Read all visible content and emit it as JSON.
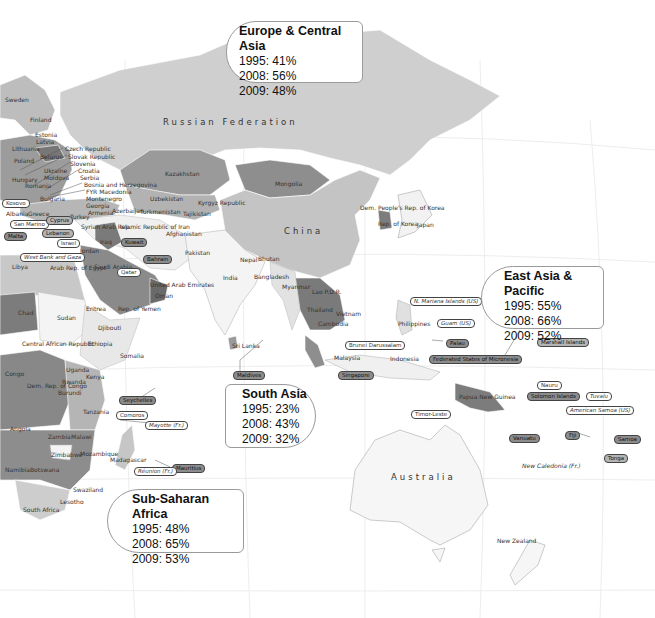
{
  "map": {
    "colors": {
      "ocean": "#ffffff",
      "graticule": "#e6e6e6",
      "shade_darkest": "#6e6e6e",
      "shade_dark": "#8f8f8f",
      "shade_mid": "#b0b0b0",
      "shade_light": "#cfcfcf",
      "shade_lightest": "#f2f2f2"
    },
    "big_labels": {
      "russia": "Russian Federation",
      "china": "China",
      "australia": "Australia"
    },
    "country_labels": [
      {
        "id": "sweden",
        "text": "Sweden",
        "x": 5,
        "y": 96
      },
      {
        "id": "finland",
        "text": "Finland",
        "x": 30,
        "y": 116
      },
      {
        "id": "estonia",
        "text": "Estonia",
        "x": 35,
        "y": 131
      },
      {
        "id": "latvia",
        "text": "Latvia",
        "x": 36,
        "y": 138
      },
      {
        "id": "lithuania",
        "text": "Lithuania",
        "x": 12,
        "y": 145
      },
      {
        "id": "poland",
        "text": "Poland",
        "x": 14,
        "y": 157
      },
      {
        "id": "belarus",
        "text": "Belarus",
        "x": 40,
        "y": 153
      },
      {
        "id": "czech",
        "text": "Czech Republic",
        "x": 65,
        "y": 145
      },
      {
        "id": "slovak",
        "text": "Slovak Republic",
        "x": 68,
        "y": 153
      },
      {
        "id": "slovenia",
        "text": "Slovenia",
        "x": 70,
        "y": 160
      },
      {
        "id": "ukraine",
        "text": "Ukraine",
        "x": 44,
        "y": 167
      },
      {
        "id": "croatia",
        "text": "Croatia",
        "x": 78,
        "y": 167
      },
      {
        "id": "hungary",
        "text": "Hungary",
        "x": 12,
        "y": 176
      },
      {
        "id": "moldova",
        "text": "Moldova",
        "x": 44,
        "y": 174
      },
      {
        "id": "serbia",
        "text": "Serbia",
        "x": 80,
        "y": 174
      },
      {
        "id": "romania",
        "text": "Romania",
        "x": 25,
        "y": 182
      },
      {
        "id": "bosnia",
        "text": "Bosnia and Herzegovina",
        "x": 84,
        "y": 181
      },
      {
        "id": "fyrom",
        "text": "FYR Macedonia",
        "x": 86,
        "y": 188
      },
      {
        "id": "montenegro",
        "text": "Montenegro",
        "x": 86,
        "y": 195
      },
      {
        "id": "georgia",
        "text": "Georgia",
        "x": 86,
        "y": 202
      },
      {
        "id": "bulgaria",
        "text": "Bulgaria",
        "x": 40,
        "y": 195
      },
      {
        "id": "armenia",
        "text": "Armenia",
        "x": 88,
        "y": 209
      },
      {
        "id": "azerbaijan",
        "text": "Azerbaijan",
        "x": 112,
        "y": 207
      },
      {
        "id": "albania",
        "text": "Albania",
        "x": 6,
        "y": 210
      },
      {
        "id": "greece",
        "text": "Greece",
        "x": 28,
        "y": 210
      },
      {
        "id": "turkey",
        "text": "Turkey",
        "x": 70,
        "y": 213
      },
      {
        "id": "kazakhstan",
        "text": "Kazakhstan",
        "x": 165,
        "y": 170
      },
      {
        "id": "mongolia",
        "text": "Mongolia",
        "x": 275,
        "y": 180
      },
      {
        "id": "uzbekistan",
        "text": "Uzbekistan",
        "x": 150,
        "y": 195
      },
      {
        "id": "kyrgyz",
        "text": "Kyrgyz Republic",
        "x": 198,
        "y": 199
      },
      {
        "id": "turkmenistan",
        "text": "Turkmenistan",
        "x": 140,
        "y": 208
      },
      {
        "id": "tajikistan",
        "text": "Tajikistan",
        "x": 183,
        "y": 210
      },
      {
        "id": "syria",
        "text": "Syrian Arab Rep.",
        "x": 81,
        "y": 223
      },
      {
        "id": "iran",
        "text": "Islamic Republic of Iran",
        "x": 120,
        "y": 223
      },
      {
        "id": "afghanistan",
        "text": "Afghanistan",
        "x": 166,
        "y": 230
      },
      {
        "id": "iraq",
        "text": "Iraq",
        "x": 100,
        "y": 238
      },
      {
        "id": "jordan",
        "text": "Jordan",
        "x": 80,
        "y": 247
      },
      {
        "id": "pakistan",
        "text": "Pakistan",
        "x": 185,
        "y": 249
      },
      {
        "id": "nepal",
        "text": "Nepal",
        "x": 240,
        "y": 256
      },
      {
        "id": "bhutan",
        "text": "Bhutan",
        "x": 258,
        "y": 255
      },
      {
        "id": "libya",
        "text": "Libya",
        "x": 12,
        "y": 263
      },
      {
        "id": "egypt",
        "text": "Arab Rep. of Egypt",
        "x": 50,
        "y": 264
      },
      {
        "id": "saudi",
        "text": "Saudi Arabia",
        "x": 94,
        "y": 263
      },
      {
        "id": "india",
        "text": "India",
        "x": 223,
        "y": 274
      },
      {
        "id": "bangladesh",
        "text": "Bangladesh",
        "x": 254,
        "y": 273
      },
      {
        "id": "uae",
        "text": "United Arab Emirates",
        "x": 150,
        "y": 281
      },
      {
        "id": "myanmar",
        "text": "Myanmar",
        "x": 282,
        "y": 283
      },
      {
        "id": "oman",
        "text": "Oman",
        "x": 155,
        "y": 292
      },
      {
        "id": "laos",
        "text": "Lao P.D.R.",
        "x": 312,
        "y": 288
      },
      {
        "id": "dprk",
        "text": "Dem. People's Rep. of Korea",
        "x": 360,
        "y": 204
      },
      {
        "id": "rok",
        "text": "Rep. of Korea",
        "x": 378,
        "y": 220
      },
      {
        "id": "japan",
        "text": "Japan",
        "x": 417,
        "y": 221
      },
      {
        "id": "thailand",
        "text": "Thailand",
        "x": 307,
        "y": 306
      },
      {
        "id": "vietnam",
        "text": "Vietnam",
        "x": 336,
        "y": 310
      },
      {
        "id": "philippines",
        "text": "Philippines",
        "x": 398,
        "y": 320
      },
      {
        "id": "cambodia",
        "text": "Cambodia",
        "x": 318,
        "y": 320
      },
      {
        "id": "chad",
        "text": "Chad",
        "x": 18,
        "y": 309
      },
      {
        "id": "sudan",
        "text": "Sudan",
        "x": 57,
        "y": 314
      },
      {
        "id": "eritrea",
        "text": "Eritrea",
        "x": 86,
        "y": 305
      },
      {
        "id": "yemen",
        "text": "Rep. of Yemen",
        "x": 118,
        "y": 305
      },
      {
        "id": "djibouti",
        "text": "Djibouti",
        "x": 98,
        "y": 324
      },
      {
        "id": "ethiopia",
        "text": "Ethiopia",
        "x": 88,
        "y": 340
      },
      {
        "id": "car",
        "text": "Central African Republic",
        "x": 22,
        "y": 340
      },
      {
        "id": "somalia",
        "text": "Somalia",
        "x": 120,
        "y": 352
      },
      {
        "id": "srilanka",
        "text": "Sri Lanka",
        "x": 232,
        "y": 342
      },
      {
        "id": "malaysia",
        "text": "Malaysia",
        "x": 334,
        "y": 354
      },
      {
        "id": "indonesia",
        "text": "Indonesia",
        "x": 390,
        "y": 355
      },
      {
        "id": "congo",
        "text": "Congo",
        "x": 5,
        "y": 370
      },
      {
        "id": "uganda",
        "text": "Uganda",
        "x": 66,
        "y": 366
      },
      {
        "id": "kenya",
        "text": "Kenya",
        "x": 86,
        "y": 373
      },
      {
        "id": "rwanda",
        "text": "Rwanda",
        "x": 62,
        "y": 378
      },
      {
        "id": "drc",
        "text": "Dem. Rep. of Congo",
        "x": 27,
        "y": 382
      },
      {
        "id": "burundi",
        "text": "Burundi",
        "x": 58,
        "y": 389
      },
      {
        "id": "png",
        "text": "Papua New Guinea",
        "x": 459,
        "y": 393
      },
      {
        "id": "tanzania",
        "text": "Tanzania",
        "x": 83,
        "y": 408
      },
      {
        "id": "angola",
        "text": "Angola",
        "x": 10,
        "y": 425
      },
      {
        "id": "zambia",
        "text": "Zambia",
        "x": 48,
        "y": 433
      },
      {
        "id": "malawi",
        "text": "Malawi",
        "x": 71,
        "y": 433
      },
      {
        "id": "zimbabwe",
        "text": "Zimbabwe",
        "x": 51,
        "y": 451
      },
      {
        "id": "mozambique",
        "text": "Mozambique",
        "x": 80,
        "y": 450
      },
      {
        "id": "madagascar",
        "text": "Madagascar",
        "x": 110,
        "y": 456
      },
      {
        "id": "namibia",
        "text": "Namibia",
        "x": 5,
        "y": 466
      },
      {
        "id": "botswana",
        "text": "Botswana",
        "x": 30,
        "y": 466
      },
      {
        "id": "swaziland",
        "text": "Swaziland",
        "x": 73,
        "y": 486
      },
      {
        "id": "lesotho",
        "text": "Lesotho",
        "x": 60,
        "y": 498
      },
      {
        "id": "southafrica",
        "text": "South Africa",
        "x": 23,
        "y": 506
      },
      {
        "id": "newzealand",
        "text": "New Zealand",
        "x": 497,
        "y": 537
      }
    ],
    "italic_labels": [
      {
        "id": "newcaledonia",
        "text": "New Caledonia (Fr.)",
        "x": 522,
        "y": 462
      }
    ],
    "pills": [
      {
        "id": "kosovo",
        "text": "Kosovo",
        "x": 2,
        "y": 199,
        "style": "light"
      },
      {
        "id": "sanmarino",
        "text": "San Marino",
        "x": 10,
        "y": 220,
        "style": "light"
      },
      {
        "id": "cyprus",
        "text": "Cyprus",
        "x": 46,
        "y": 216,
        "style": "mid"
      },
      {
        "id": "lebanon",
        "text": "Lebanon",
        "x": 42,
        "y": 229,
        "style": "mid"
      },
      {
        "id": "malta",
        "text": "Malta",
        "x": 4,
        "y": 232,
        "style": "dark"
      },
      {
        "id": "kuwait",
        "text": "Kuwait",
        "x": 121,
        "y": 238,
        "style": "dark"
      },
      {
        "id": "israel",
        "text": "Israel",
        "x": 57,
        "y": 239,
        "style": "light"
      },
      {
        "id": "westbank",
        "text": "West Bank and Gaza",
        "x": 20,
        "y": 253,
        "style": "light",
        "italic": true
      },
      {
        "id": "bahrain",
        "text": "Bahrain",
        "x": 143,
        "y": 255,
        "style": "dark"
      },
      {
        "id": "qatar",
        "text": "Qatar",
        "x": 117,
        "y": 268,
        "style": "light"
      },
      {
        "id": "nmariana",
        "text": "N. Mariana Islands (US)",
        "x": 410,
        "y": 297,
        "style": "light",
        "italic": true
      },
      {
        "id": "guam",
        "text": "Guam (US)",
        "x": 437,
        "y": 319,
        "style": "light",
        "italic": true
      },
      {
        "id": "palau",
        "text": "Palau",
        "x": 446,
        "y": 339,
        "style": "dark"
      },
      {
        "id": "marshall",
        "text": "Marshall Islands",
        "x": 537,
        "y": 338,
        "style": "mid"
      },
      {
        "id": "brunei",
        "text": "Brunei Darussalam",
        "x": 345,
        "y": 341,
        "style": "light"
      },
      {
        "id": "micronesia",
        "text": "Federated States of Micronesia",
        "x": 429,
        "y": 355,
        "style": "dark"
      },
      {
        "id": "maldives",
        "text": "Maldives",
        "x": 233,
        "y": 371,
        "style": "dark"
      },
      {
        "id": "singapore",
        "text": "Singapore",
        "x": 338,
        "y": 371,
        "style": "dark"
      },
      {
        "id": "nauru",
        "text": "Nauru",
        "x": 537,
        "y": 381,
        "style": "light"
      },
      {
        "id": "seychelles",
        "text": "Seychelles",
        "x": 119,
        "y": 396,
        "style": "dark"
      },
      {
        "id": "solomon",
        "text": "Solomon Islands",
        "x": 527,
        "y": 392,
        "style": "dark"
      },
      {
        "id": "tuvalu",
        "text": "Tuvalu",
        "x": 586,
        "y": 392,
        "style": "light",
        "italic": true
      },
      {
        "id": "comoros",
        "text": "Comoros",
        "x": 116,
        "y": 411,
        "style": "light"
      },
      {
        "id": "amsamoa",
        "text": "American Samoa (US)",
        "x": 566,
        "y": 406,
        "style": "light",
        "italic": true
      },
      {
        "id": "timorleste",
        "text": "Timor-Leste",
        "x": 411,
        "y": 410,
        "style": "light"
      },
      {
        "id": "mayotte",
        "text": "Mayotte (Fr.)",
        "x": 145,
        "y": 421,
        "style": "light",
        "italic": true
      },
      {
        "id": "vanuatu",
        "text": "Vanuatu",
        "x": 509,
        "y": 434,
        "style": "dark"
      },
      {
        "id": "fiji",
        "text": "Fiji",
        "x": 565,
        "y": 431,
        "style": "dark"
      },
      {
        "id": "samoa",
        "text": "Samoa",
        "x": 614,
        "y": 435,
        "style": "dark"
      },
      {
        "id": "tonga",
        "text": "Tonga",
        "x": 604,
        "y": 454,
        "style": "mid"
      },
      {
        "id": "mauritius",
        "text": "Mauritius",
        "x": 172,
        "y": 464,
        "style": "dark"
      },
      {
        "id": "reunion",
        "text": "Réunion (Fr.)",
        "x": 134,
        "y": 467,
        "style": "light",
        "italic": true
      }
    ]
  },
  "callouts": [
    {
      "id": "europe-central-asia",
      "title": "Europe & Central Asia",
      "rows": [
        "1995: 41%",
        "2008: 56%",
        "2009: 48%"
      ]
    },
    {
      "id": "east-asia-pacific",
      "title": "East Asia & Pacific",
      "rows": [
        "1995: 55%",
        "2008: 66%",
        "2009: 52%"
      ]
    },
    {
      "id": "south-asia",
      "title": "South Asia",
      "rows": [
        "1995: 23%",
        "2008: 43%",
        "2009: 32%"
      ]
    },
    {
      "id": "sub-saharan-africa",
      "title": "Sub-Saharan Africa",
      "rows": [
        "1995: 48%",
        "2008: 65%",
        "2009: 53%"
      ]
    }
  ]
}
